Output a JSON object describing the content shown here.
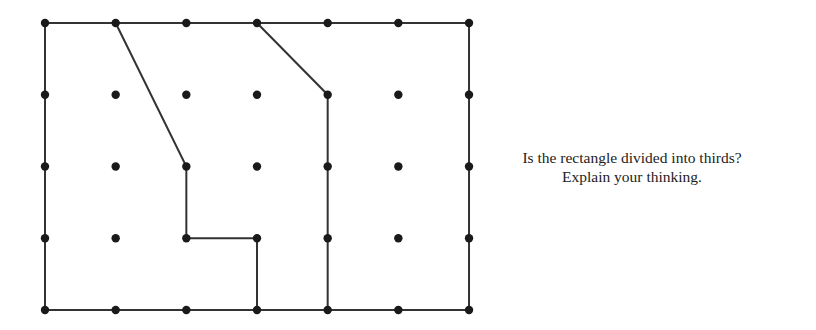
{
  "question": {
    "line1": "Is the rectangle divided into thirds?",
    "line2": "Explain your thinking."
  },
  "diagram": {
    "type": "dot-grid-partition",
    "grid": {
      "columns": 7,
      "rows": 5,
      "origin_px": [
        45,
        23
      ],
      "spacing_px": [
        70.67,
        71.75
      ]
    },
    "colors": {
      "line": "#333333",
      "dot": "#1a1a1a",
      "background": "#ffffff"
    },
    "rectangle": {
      "from": [
        0,
        0
      ],
      "to": [
        6,
        4
      ]
    },
    "partition_lines": [
      {
        "name": "left-divider",
        "points": [
          [
            1,
            0
          ],
          [
            2,
            2
          ],
          [
            2,
            3
          ],
          [
            3,
            3
          ],
          [
            3,
            4
          ]
        ]
      },
      {
        "name": "right-divider",
        "points": [
          [
            3,
            0
          ],
          [
            4,
            1
          ],
          [
            4,
            4
          ]
        ]
      }
    ]
  }
}
